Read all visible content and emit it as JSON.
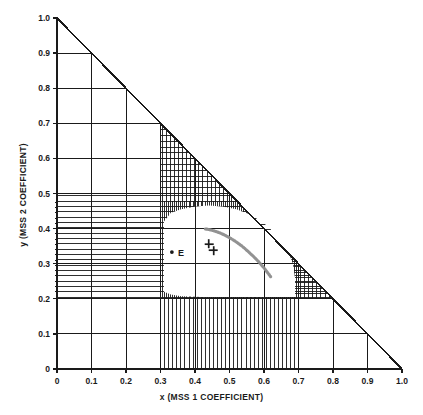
{
  "chart_data": {
    "type": "scatter",
    "title": "",
    "xlabel": "x (MSS 1 COEFFICIENT)",
    "ylabel": "y (MSS 2 COEFFICIENT)",
    "xlim": [
      0,
      1.0
    ],
    "ylim": [
      0,
      1.0
    ],
    "grid": true,
    "legend": "none",
    "xticks": [
      0,
      0.1,
      0.2,
      0.3,
      0.4,
      0.5,
      0.6,
      0.7,
      0.8,
      0.9,
      1.0
    ],
    "xticklabels": [
      "0",
      "0.1",
      "0.2",
      "0.3",
      "0.4",
      "0.5",
      "0.6",
      "0.7",
      "0.8",
      "0.9",
      "1.0"
    ],
    "yticks": [
      0,
      0.1,
      0.2,
      0.3,
      0.4,
      0.5,
      0.6,
      0.7,
      0.8,
      0.9,
      1.0
    ],
    "yticklabels": [
      "0",
      "0.1",
      "0.2",
      "0.3",
      "0.4",
      "0.5",
      "0.6",
      "0.7",
      "0.8",
      "0.9",
      "1.0"
    ],
    "y_minor_ticks": [
      0.22,
      0.235,
      0.25,
      0.265,
      0.28,
      0.295,
      0.31,
      0.325,
      0.34,
      0.355,
      0.37,
      0.385,
      0.4,
      0.415,
      0.43,
      0.445,
      0.46,
      0.475
    ],
    "constraint_boundary": {
      "name": "feasible-region-outline",
      "closed": true,
      "points": [
        [
          0.31,
          0.22
        ],
        [
          0.31,
          0.42
        ],
        [
          0.33,
          0.445
        ],
        [
          0.36,
          0.455
        ],
        [
          0.4,
          0.463
        ],
        [
          0.44,
          0.466
        ],
        [
          0.48,
          0.463
        ],
        [
          0.52,
          0.455
        ],
        [
          0.56,
          0.44
        ],
        [
          0.6,
          0.415
        ],
        [
          0.64,
          0.38
        ],
        [
          0.668,
          0.34
        ],
        [
          0.684,
          0.3
        ],
        [
          0.69,
          0.26
        ],
        [
          0.69,
          0.205
        ],
        [
          0.62,
          0.205
        ],
        [
          0.52,
          0.205
        ],
        [
          0.42,
          0.205
        ],
        [
          0.36,
          0.207
        ],
        [
          0.33,
          0.212
        ]
      ]
    },
    "hatching": [
      {
        "region": "left-of-region",
        "orientation": "horizontal",
        "x_from": 0.0,
        "y_from": 0.205,
        "y_to": 0.5
      },
      {
        "region": "below-region",
        "orientation": "vertical",
        "x_from": 0.312,
        "x_to": 0.695,
        "y_from": 0.0
      },
      {
        "region": "upper-wedge",
        "orientation": "vertical",
        "x_from": 0.31,
        "x_to": 0.93,
        "note": "between region top and diagonal x+y=1"
      },
      {
        "region": "upper-wedge",
        "orientation": "horizontal",
        "note": "cross-hatch near diagonal"
      }
    ],
    "diagonal_line": {
      "name": "x+y=1 boundary",
      "from": [
        0.0,
        1.0
      ],
      "to": [
        1.0,
        0.0
      ]
    },
    "annotations": [
      {
        "name": "equal-energy-point",
        "label": "E",
        "x": 0.333,
        "y": 0.333,
        "marker": "dot"
      },
      {
        "name": "white-point-cross",
        "label": "",
        "x": 0.447,
        "y": 0.347,
        "marker": "cross"
      }
    ],
    "series": [
      {
        "name": "planckian-locus",
        "style": "dotted-grey-curve",
        "color": "#8c8c8c",
        "points": [
          [
            0.43,
            0.399
          ],
          [
            0.447,
            0.396
          ],
          [
            0.46,
            0.392
          ],
          [
            0.474,
            0.387
          ],
          [
            0.487,
            0.381
          ],
          [
            0.5,
            0.374
          ],
          [
            0.512,
            0.367
          ],
          [
            0.524,
            0.359
          ],
          [
            0.535,
            0.351
          ],
          [
            0.546,
            0.342
          ],
          [
            0.556,
            0.333
          ],
          [
            0.566,
            0.324
          ],
          [
            0.575,
            0.315
          ],
          [
            0.584,
            0.306
          ],
          [
            0.592,
            0.297
          ],
          [
            0.6,
            0.288
          ],
          [
            0.607,
            0.279
          ],
          [
            0.614,
            0.27
          ],
          [
            0.62,
            0.262
          ]
        ]
      }
    ]
  }
}
